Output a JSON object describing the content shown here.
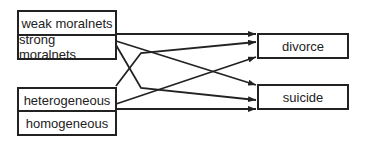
{
  "diagram": {
    "sources": {
      "morality": [
        "weak moralnets",
        "strong moralnets"
      ],
      "heterogeneity": [
        "heterogeneous",
        "homogeneous"
      ]
    },
    "targets": [
      "divorce",
      "suicide"
    ],
    "colors": {
      "line": "#222222",
      "background": "#ffffff"
    },
    "edges": [
      {
        "from": "weak moralnets",
        "to": "divorce"
      },
      {
        "from": "strong moralnets",
        "to": "suicide"
      },
      {
        "from": "strong moralnets",
        "to": "suicide"
      },
      {
        "from": "heterogeneous",
        "to": "divorce"
      },
      {
        "from": "heterogeneous",
        "to": "divorce"
      },
      {
        "from": "homogeneous",
        "to": "suicide"
      }
    ]
  }
}
